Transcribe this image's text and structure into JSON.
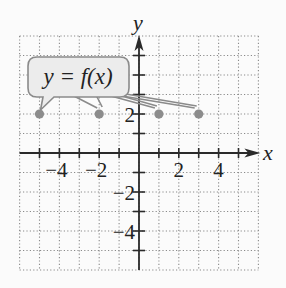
{
  "graph": {
    "x_axis_label": "x",
    "y_axis_label": "y",
    "x_range": [
      -6,
      6
    ],
    "y_range": [
      -6,
      6
    ],
    "grid_step": 1,
    "x_tick_labels": [
      {
        "value": -4,
        "text": "−4"
      },
      {
        "value": -2,
        "text": "−2"
      },
      {
        "value": 2,
        "text": "2"
      },
      {
        "value": 4,
        "text": "4"
      }
    ],
    "y_tick_labels": [
      {
        "value": 2,
        "text": "2"
      },
      {
        "value": -2,
        "text": "−2"
      },
      {
        "value": -4,
        "text": "−4"
      }
    ],
    "points": [
      {
        "x": -5,
        "y": 2
      },
      {
        "x": -2,
        "y": 2
      },
      {
        "x": 1,
        "y": 2
      },
      {
        "x": 3,
        "y": 2
      }
    ],
    "callout": {
      "text": "y = f(x)"
    },
    "colors": {
      "grid": "#8a8a8a",
      "axis": "#2a2a2a",
      "point": "#8c8c8c",
      "callout_fill": "#ececec",
      "callout_stroke": "#8a8a8a"
    }
  }
}
